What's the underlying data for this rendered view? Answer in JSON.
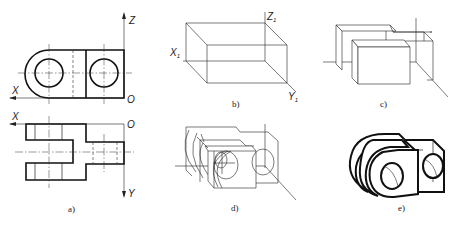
{
  "figure": {
    "panels": [
      {
        "id": "a",
        "caption": "a)",
        "description": "Orthographic front and top views of a clevis-like part with two bores",
        "axis_labels": {
          "z": "Z",
          "x_front": "X",
          "o_front": "O",
          "x_top": "X",
          "o_top": "O",
          "y": "Y"
        }
      },
      {
        "id": "b",
        "caption": "b)",
        "description": "Bounding box in isometric axes",
        "axis_labels": {
          "x1": "X",
          "z1": "Z",
          "y1": "Y",
          "subscript": "1"
        }
      },
      {
        "id": "c",
        "caption": "c)",
        "description": "Isometric block-out of prongs and step"
      },
      {
        "id": "d",
        "caption": "d)",
        "description": "Isometric construction with ellipses for rounded ends and holes"
      },
      {
        "id": "e",
        "caption": "e)",
        "description": "Finished isometric drawing with bold visible outlines"
      }
    ]
  }
}
